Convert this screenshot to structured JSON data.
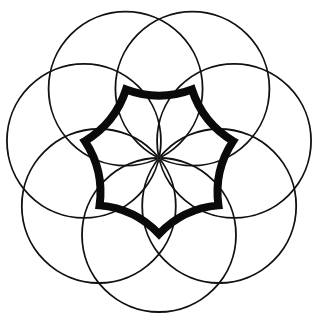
{
  "figure": {
    "canvas": {
      "width": 317,
      "height": 323,
      "background": "#ffffff"
    },
    "center": {
      "x": 159,
      "y": 158
    },
    "circles": {
      "count": 7,
      "radius": 77,
      "center_distance": 77,
      "start_angle_deg": 90,
      "stroke": "#111111",
      "stroke_width": 1.8
    },
    "star": {
      "points": 7,
      "outer_radius": 76,
      "control_radius": 56,
      "start_angle_deg": 90,
      "stroke": "#0a0a0a",
      "stroke_width": 8
    },
    "center_dot": {
      "radius": 2,
      "stroke": "#333333"
    }
  }
}
